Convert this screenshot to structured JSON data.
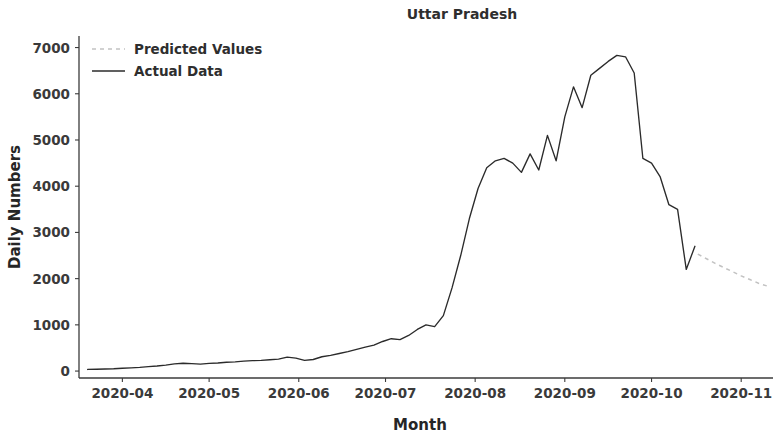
{
  "figure": {
    "width": 775,
    "height": 436,
    "background": "#ffffff"
  },
  "chart_data": {
    "type": "line",
    "title": "Uttar Pradesh",
    "xlabel": "Month",
    "ylabel": "Daily Numbers",
    "grid": false,
    "legend_position": "upper left",
    "xlim": [
      "2020-03-17",
      "2020-11-12"
    ],
    "ylim": [
      -150,
      7250
    ],
    "ytick_labels": [
      "0",
      "1000",
      "2000",
      "3000",
      "4000",
      "5000",
      "6000",
      "7000"
    ],
    "ytick_values": [
      0,
      1000,
      2000,
      3000,
      4000,
      5000,
      6000,
      7000
    ],
    "xtick_labels": [
      "2020-04",
      "2020-05",
      "2020-06",
      "2020-07",
      "2020-08",
      "2020-09",
      "2020-10",
      "2020-11"
    ],
    "xtick_values": [
      "2020-04-01",
      "2020-05-01",
      "2020-06-01",
      "2020-07-01",
      "2020-08-01",
      "2020-09-01",
      "2020-10-01",
      "2020-11-01"
    ],
    "series": [
      {
        "name": "Predicted Values",
        "style": "dashed",
        "color": "#c2c2c2",
        "x": [
          "2020-10-17",
          "2020-10-20",
          "2020-10-23",
          "2020-10-26",
          "2020-10-29",
          "2020-11-01",
          "2020-11-04",
          "2020-11-07",
          "2020-11-10"
        ],
        "values": [
          2530,
          2430,
          2330,
          2240,
          2150,
          2060,
          1980,
          1900,
          1840
        ]
      },
      {
        "name": "Actual Data",
        "style": "solid",
        "color": "#2b2b2b",
        "x": [
          "2020-03-20",
          "2020-03-23",
          "2020-03-26",
          "2020-03-29",
          "2020-04-01",
          "2020-04-04",
          "2020-04-07",
          "2020-04-10",
          "2020-04-13",
          "2020-04-16",
          "2020-04-19",
          "2020-04-22",
          "2020-04-25",
          "2020-04-28",
          "2020-05-01",
          "2020-05-04",
          "2020-05-07",
          "2020-05-10",
          "2020-05-13",
          "2020-05-16",
          "2020-05-19",
          "2020-05-22",
          "2020-05-25",
          "2020-05-28",
          "2020-05-31",
          "2020-06-03",
          "2020-06-06",
          "2020-06-09",
          "2020-06-12",
          "2020-06-15",
          "2020-06-18",
          "2020-06-21",
          "2020-06-24",
          "2020-06-27",
          "2020-06-30",
          "2020-07-03",
          "2020-07-06",
          "2020-07-09",
          "2020-07-12",
          "2020-07-15",
          "2020-07-18",
          "2020-07-21",
          "2020-07-24",
          "2020-07-27",
          "2020-07-30",
          "2020-08-02",
          "2020-08-05",
          "2020-08-08",
          "2020-08-11",
          "2020-08-14",
          "2020-08-17",
          "2020-08-20",
          "2020-08-23",
          "2020-08-26",
          "2020-08-29",
          "2020-09-01",
          "2020-09-04",
          "2020-09-07",
          "2020-09-10",
          "2020-09-13",
          "2020-09-16",
          "2020-09-19",
          "2020-09-22",
          "2020-09-25",
          "2020-09-28",
          "2020-10-01",
          "2020-10-04",
          "2020-10-07",
          "2020-10-10",
          "2020-10-13",
          "2020-10-16"
        ],
        "values": [
          35,
          40,
          45,
          50,
          60,
          70,
          80,
          95,
          110,
          130,
          155,
          170,
          160,
          150,
          165,
          175,
          190,
          200,
          215,
          225,
          230,
          245,
          260,
          300,
          280,
          230,
          250,
          310,
          340,
          380,
          420,
          470,
          520,
          560,
          640,
          700,
          680,
          770,
          900,
          1000,
          960,
          1200,
          1800,
          2500,
          3300,
          3950,
          4400,
          4550,
          4600,
          4500,
          4300,
          4700,
          4350,
          5100,
          4550,
          5500,
          6150,
          5700,
          6400,
          6550,
          6700,
          6830,
          6800,
          6450,
          4600,
          4500,
          4200,
          3600,
          3500,
          2200,
          2700
        ]
      }
    ]
  },
  "legend": {
    "entries": [
      {
        "label": "Predicted Values",
        "style": "dashed",
        "color": "#c2c2c2"
      },
      {
        "label": "Actual Data",
        "style": "solid",
        "color": "#2b2b2b"
      }
    ]
  }
}
